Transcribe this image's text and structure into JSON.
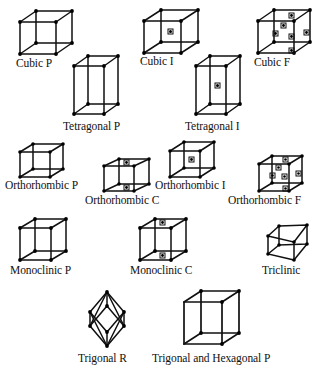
{
  "figure": {
    "background_color": "#ffffff",
    "line_color": "#111111",
    "vertex_color": "#000000",
    "lattice_point_color": "#000000"
  },
  "cells": [
    {
      "id": "cubic-p",
      "label": "Cubic P",
      "symbol": "P",
      "system": "Cubic",
      "centering": "primitive",
      "interior_points": 0,
      "face_points": 0,
      "label_x": 16,
      "label_y": 57
    },
    {
      "id": "cubic-i",
      "label": "Cubic I",
      "symbol": "I",
      "system": "Cubic",
      "centering": "body-centered",
      "interior_points": 1,
      "face_points": 0,
      "label_x": 140,
      "label_y": 55
    },
    {
      "id": "cubic-f",
      "label": "Cubic F",
      "symbol": "F",
      "system": "Cubic",
      "centering": "face-centered",
      "interior_points": 0,
      "face_points": 6,
      "label_x": 254,
      "label_y": 56
    },
    {
      "id": "tetragonal-p",
      "label": "Tetragonal P",
      "symbol": "P",
      "system": "Tetragonal",
      "centering": "primitive",
      "interior_points": 0,
      "face_points": 0,
      "label_x": 63,
      "label_y": 120
    },
    {
      "id": "tetragonal-i",
      "label": "Tetragonal I",
      "symbol": "I",
      "system": "Tetragonal",
      "centering": "body-centered",
      "interior_points": 1,
      "face_points": 0,
      "label_x": 185,
      "label_y": 120
    },
    {
      "id": "orthorhombic-p",
      "label": "Orthorhombic P",
      "symbol": "P",
      "system": "Orthorhombic",
      "centering": "primitive",
      "interior_points": 0,
      "face_points": 0,
      "label_x": 5,
      "label_y": 179
    },
    {
      "id": "orthorhombic-c",
      "label": "Orthorhombic C",
      "symbol": "C",
      "system": "Orthorhombic",
      "centering": "base-centered",
      "interior_points": 0,
      "face_points": 2,
      "label_x": 85,
      "label_y": 194
    },
    {
      "id": "orthorhombic-i",
      "label": "Orthorhombic I",
      "symbol": "I",
      "system": "Orthorhombic",
      "centering": "body-centered",
      "interior_points": 1,
      "face_points": 0,
      "label_x": 155,
      "label_y": 179
    },
    {
      "id": "orthorhombic-f",
      "label": "Orthorhombic F",
      "symbol": "F",
      "system": "Orthorhombic",
      "centering": "face-centered",
      "interior_points": 0,
      "face_points": 6,
      "label_x": 228,
      "label_y": 194
    },
    {
      "id": "monoclinic-p",
      "label": "Monoclinic P",
      "symbol": "P",
      "system": "Monoclinic",
      "centering": "primitive",
      "interior_points": 0,
      "face_points": 0,
      "label_x": 10,
      "label_y": 264
    },
    {
      "id": "monoclinic-c",
      "label": "Monoclinic C",
      "symbol": "C",
      "system": "Monoclinic",
      "centering": "base-centered",
      "interior_points": 0,
      "face_points": 2,
      "label_x": 130,
      "label_y": 264
    },
    {
      "id": "triclinic",
      "label": "Triclinic",
      "symbol": "P",
      "system": "Triclinic",
      "centering": "primitive",
      "interior_points": 0,
      "face_points": 0,
      "label_x": 262,
      "label_y": 264
    },
    {
      "id": "trigonal-r",
      "label": "Trigonal R",
      "symbol": "R",
      "system": "Trigonal",
      "centering": "rhombohedral",
      "interior_points": 0,
      "face_points": 0,
      "label_x": 78,
      "label_y": 352
    },
    {
      "id": "trigonal-hexagonal-p",
      "label": "Trigonal and Hexagonal P",
      "symbol": "P",
      "system": "Trigonal and Hexagonal",
      "centering": "primitive",
      "interior_points": 0,
      "face_points": 0,
      "label_x": 152,
      "label_y": 352
    }
  ]
}
